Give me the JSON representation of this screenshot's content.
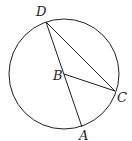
{
  "diagram": {
    "type": "geometry-circle",
    "circle": {
      "center": "B",
      "cx": 64,
      "cy": 74,
      "r": 55
    },
    "points": {
      "D": {
        "label": "D",
        "x": 46,
        "y": 22,
        "lx": 36,
        "ly": 16
      },
      "B": {
        "label": "B",
        "x": 64,
        "y": 74,
        "lx": 53,
        "ly": 80
      },
      "C": {
        "label": "C",
        "x": 115,
        "y": 91,
        "lx": 117,
        "ly": 102
      },
      "A": {
        "label": "A",
        "x": 82,
        "y": 127,
        "lx": 79,
        "ly": 140
      }
    },
    "segments": [
      {
        "from": "D",
        "to": "A"
      },
      {
        "from": "D",
        "to": "C"
      },
      {
        "from": "B",
        "to": "C"
      }
    ],
    "stroke_color": "#231f20"
  }
}
